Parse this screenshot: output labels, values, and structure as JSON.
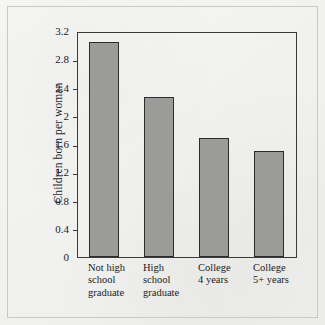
{
  "figure": {
    "y_axis_title": "Children born per woman"
  },
  "chart_data": {
    "type": "bar",
    "title": "",
    "xlabel": "",
    "ylabel": "Children born per woman",
    "ylim": [
      0,
      3.2
    ],
    "grid": false,
    "legend": "none",
    "categories": [
      "Not high school graduate",
      "High school graduate",
      "College 4 years",
      "College 5+ years"
    ],
    "category_lines": [
      [
        "Not high",
        "school",
        "graduate"
      ],
      [
        "High",
        "school",
        "graduate"
      ],
      [
        "College",
        "4 years"
      ],
      [
        "College",
        "5+ years"
      ]
    ],
    "values": [
      3.05,
      2.27,
      1.68,
      1.5
    ],
    "ytick_labels": [
      "3.2",
      "2.8",
      "2.4",
      "2",
      "1.6",
      "1.2",
      "0.8",
      "0.4",
      "0"
    ],
    "ytick_values": [
      3.2,
      2.8,
      2.4,
      2.0,
      1.6,
      1.2,
      0.8,
      0.4,
      0
    ],
    "bar_color": "#9b9b9a",
    "bar_edge_color": "#2c2c2c",
    "axis_color": "#3a3a3a",
    "background_color": "#f2f2f0"
  }
}
